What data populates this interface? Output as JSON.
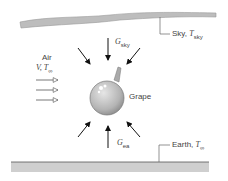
{
  "labels": {
    "sky": "Sky, ",
    "sky_T": "T",
    "sky_T_sub": "sky",
    "earth": "Earth, ",
    "earth_T": "T",
    "earth_T_sub": "∞",
    "air": "Air",
    "air_vars": "V, T",
    "air_vars_sub": "∞",
    "grape": "Grape",
    "g_sky": "G",
    "g_sky_sub": "sky",
    "g_ea": "G",
    "g_ea_sub": "ea"
  },
  "colors": {
    "sky_band": "#b8b8b8",
    "earth_band": "#c8c8c8",
    "grape": "#c4c4c4",
    "arrow": "#111111"
  }
}
